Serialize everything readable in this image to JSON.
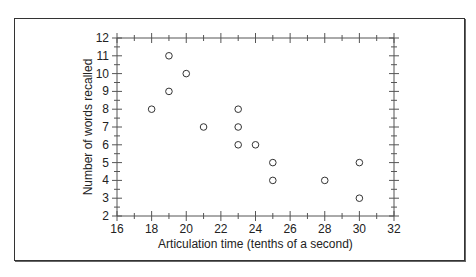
{
  "chart_data": {
    "type": "scatter",
    "title": "",
    "xlabel": "Articulation time (tenths of a second)",
    "ylabel": "Number of words recalled",
    "xlim": [
      16,
      32
    ],
    "ylim": [
      2,
      12
    ],
    "xticks": [
      16,
      18,
      20,
      22,
      24,
      26,
      28,
      30,
      32
    ],
    "yticks": [
      2,
      3,
      4,
      5,
      6,
      7,
      8,
      9,
      10,
      11,
      12
    ],
    "grid": false,
    "legend": null,
    "marker": "open-circle",
    "points": [
      {
        "x": 18,
        "y": 8
      },
      {
        "x": 19,
        "y": 11
      },
      {
        "x": 19,
        "y": 9
      },
      {
        "x": 20,
        "y": 10
      },
      {
        "x": 21,
        "y": 7
      },
      {
        "x": 23,
        "y": 8
      },
      {
        "x": 23,
        "y": 7
      },
      {
        "x": 23,
        "y": 6
      },
      {
        "x": 24,
        "y": 6
      },
      {
        "x": 25,
        "y": 5
      },
      {
        "x": 25,
        "y": 4
      },
      {
        "x": 28,
        "y": 4
      },
      {
        "x": 30,
        "y": 5
      },
      {
        "x": 30,
        "y": 3
      }
    ]
  },
  "colors": {
    "axis": "#555555",
    "marker": "#333333",
    "frame": "#333333"
  }
}
